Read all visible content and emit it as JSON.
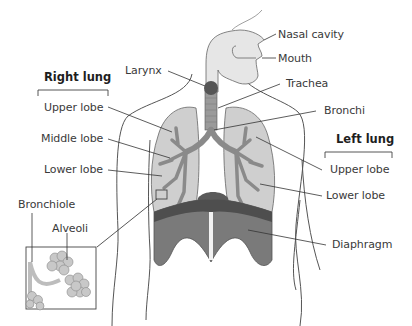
{
  "diagram": {
    "type": "anatomy",
    "headings": {
      "right_lung": "Right lung",
      "left_lung": "Left lung"
    },
    "labels": {
      "nasal_cavity": "Nasal cavity",
      "mouth": "Mouth",
      "larynx": "Larynx",
      "trachea": "Trachea",
      "bronchi": "Bronchi",
      "right_upper_lobe": "Upper lobe",
      "right_middle_lobe": "Middle lobe",
      "right_lower_lobe": "Lower lobe",
      "left_upper_lobe": "Upper lobe",
      "left_lower_lobe": "Lower lobe",
      "diaphragm": "Diaphragm",
      "bronchiole": "Bronchiole",
      "alveoli": "Alveoli"
    },
    "colors": {
      "outline": "#444444",
      "lung_fill": "#cfcfcf",
      "bronchi_fill": "#8a8a8a",
      "trachea_fill": "#9a9a9a",
      "larynx_fill": "#555555",
      "diaphragm_fill": "#7a7a7a",
      "diaphragm_dark": "#4e4e4e",
      "airway_light": "#e6e6e6",
      "alveoli_fill": "#c8c8c8",
      "text": "#3a3a3a"
    }
  }
}
